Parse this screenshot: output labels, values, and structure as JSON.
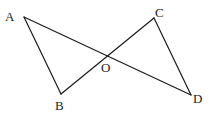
{
  "diagram": {
    "type": "geometry",
    "colors": {
      "line": "#1a1a1a",
      "label": "#222222",
      "background": "#ffffff"
    },
    "points": {
      "A": {
        "label": "A",
        "x": 24,
        "y": 17,
        "label_x": 5,
        "label_y": 21
      },
      "B": {
        "label": "B",
        "x": 61,
        "y": 94,
        "label_x": 55,
        "label_y": 110
      },
      "C": {
        "label": "C",
        "x": 154,
        "y": 18,
        "label_x": 155,
        "label_y": 17
      },
      "D": {
        "label": "D",
        "x": 191,
        "y": 95,
        "label_x": 193,
        "label_y": 103
      },
      "O": {
        "label": "O",
        "x": 107,
        "y": 56,
        "label_x": 101,
        "label_y": 72
      }
    },
    "segments": [
      {
        "name": "AB",
        "from": "A",
        "to": "B"
      },
      {
        "name": "AD",
        "from": "A",
        "to": "D"
      },
      {
        "name": "BC",
        "from": "B",
        "to": "C"
      },
      {
        "name": "CD",
        "from": "C",
        "to": "D"
      }
    ]
  }
}
